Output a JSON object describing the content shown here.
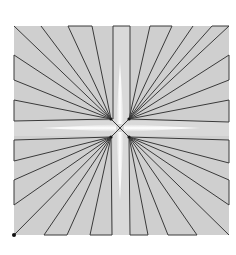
{
  "caption": "",
  "diagram": {
    "type": "fan-line star pattern",
    "frame": {
      "x": 14,
      "y": 26,
      "width": 215,
      "height": 209,
      "fill": "#cfcfcf"
    },
    "center": [
      120,
      128
    ],
    "hubs": {
      "top_left": [
        111,
        119
      ],
      "top_right": [
        129,
        119
      ],
      "bottom_left": [
        111,
        137
      ],
      "bottom_right": [
        129,
        137
      ]
    },
    "colors": {
      "line": "#3a3a3a",
      "fill": "#cfcfcf",
      "highlight": "#f4f4f4",
      "background": "#ffffff"
    },
    "marker": {
      "x": 14,
      "y": 235
    }
  }
}
